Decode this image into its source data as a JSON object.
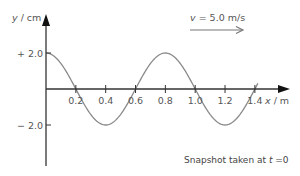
{
  "diagram": {
    "y_axis": {
      "label": "y / cm",
      "label_var": "y",
      "label_unit": " / cm"
    },
    "x_axis": {
      "label": "x / m",
      "label_var": "x",
      "label_unit": " / m"
    },
    "y_ticks": [
      {
        "value": 2.0,
        "label": "+ 2.0"
      },
      {
        "value": -2.0,
        "label": "− 2.0"
      }
    ],
    "x_ticks": [
      {
        "value": 0.2,
        "label": "0.2"
      },
      {
        "value": 0.4,
        "label": "0.4"
      },
      {
        "value": 0.6,
        "label": "0.6"
      },
      {
        "value": 0.8,
        "label": "0.8"
      },
      {
        "value": 1.0,
        "label": "1.0"
      },
      {
        "value": 1.2,
        "label": "1.2"
      },
      {
        "value": 1.4,
        "label": "1.4"
      }
    ],
    "velocity": {
      "var": "v",
      "text": " = 5.0 m/s",
      "direction": "right"
    },
    "caption": {
      "text": "Snapshot taken at ",
      "var": "t",
      "suffix": " =0"
    },
    "wave": {
      "amplitude_cm": 2.0,
      "wavelength_m": 0.8,
      "x_start_m": 0.0,
      "x_end_m": 1.42,
      "form": "y = 2.0 cos(2πx / 0.8)"
    },
    "colors": {
      "axis": "#333333",
      "wave": "#8a8a8a",
      "arrow": "#777777",
      "text": "#555555"
    }
  }
}
